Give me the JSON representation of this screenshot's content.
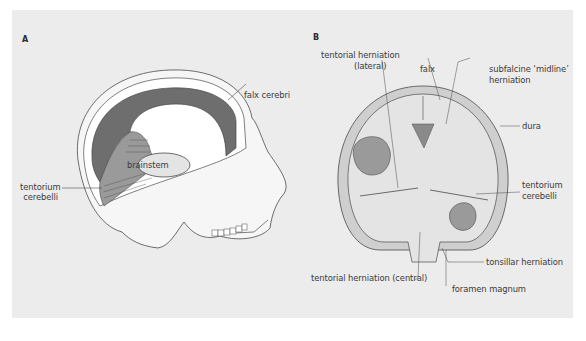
{
  "figure": {
    "panel_a": {
      "letter": "A",
      "labels": {
        "falx_cerebri": "falx cerebri",
        "brainstem": "brainstem",
        "tentorium_line1": "tentorium",
        "tentorium_line2": "cerebelli"
      }
    },
    "panel_b": {
      "letter": "B",
      "labels": {
        "tentorial_lateral_line1": "tentorial herniation",
        "tentorial_lateral_line2": "(lateral)",
        "falx": "falx",
        "subfalcine_line1": "subfalcine ‘midline’",
        "subfalcine_line2": "herniation",
        "dura": "dura",
        "tentorium_line1": "tentorium",
        "tentorium_line2": "cerebelli",
        "tonsillar": "tonsillar herniation",
        "tentorial_central": "tentorial herniation (central)",
        "foramen_magnum": "foramen magnum"
      }
    },
    "colors": {
      "background": "#ececec",
      "dark_fill": "#6e6e6e",
      "mid_fill": "#9a9a9a",
      "light_fill": "#e4e4e4",
      "outline": "#4a4a4a",
      "text": "#3a3a3a"
    }
  }
}
